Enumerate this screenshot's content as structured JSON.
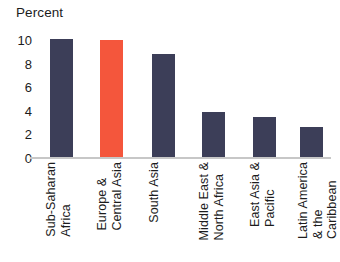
{
  "chart_data": {
    "type": "bar",
    "title": "Percent",
    "xlabel": "",
    "ylabel": "Percent",
    "ylim": [
      0,
      10
    ],
    "yticks": [
      "10",
      "8",
      "6",
      "4",
      "2",
      "0"
    ],
    "ytick_values": [
      10,
      8,
      6,
      4,
      2,
      0
    ],
    "grid": false,
    "legend": "none",
    "categories": [
      "Sub-Saharan\nAfrica",
      "Europe &\nCentral Asia",
      "South Asia",
      "Middle East &\nNorth Africa",
      "East Asia &\nPacific",
      "Latin America\n& the\nCaribbean"
    ],
    "values": [
      10.1,
      10.0,
      8.8,
      3.9,
      3.5,
      2.6
    ],
    "bar_colors": [
      "#3c3e58",
      "#f4563c",
      "#3c3e58",
      "#3c3e58",
      "#3c3e58",
      "#3c3e58"
    ],
    "highlight_category": "Europe & Central Asia",
    "colors": {
      "default_bar": "#3c3e58",
      "highlight_bar": "#f4563c",
      "axis_line": "#c7c7c7",
      "text": "#1c1c1c",
      "background": "#ffffff"
    }
  }
}
